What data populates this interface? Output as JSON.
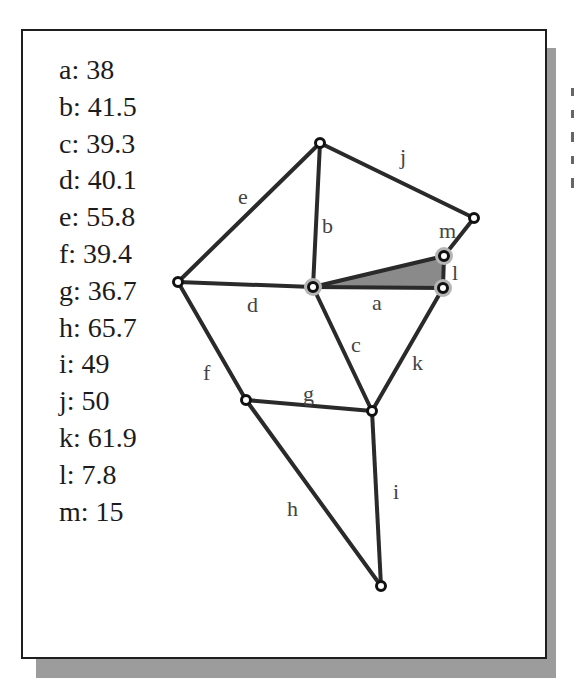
{
  "legend": {
    "items": [
      {
        "label": "a: 38"
      },
      {
        "label": "b: 41.5"
      },
      {
        "label": "c: 39.3"
      },
      {
        "label": "d: 40.1"
      },
      {
        "label": "e: 55.8"
      },
      {
        "label": "f: 39.4"
      },
      {
        "label": "g: 36.7"
      },
      {
        "label": "h: 65.7"
      },
      {
        "label": "i: 49"
      },
      {
        "label": "j: 50"
      },
      {
        "label": "k: 61.9"
      },
      {
        "label": "l: 7.8"
      },
      {
        "label": "m: 15"
      }
    ]
  },
  "graph": {
    "edges": [
      {
        "name": "a",
        "length": 38
      },
      {
        "name": "b",
        "length": 41.5
      },
      {
        "name": "c",
        "length": 39.3
      },
      {
        "name": "d",
        "length": 40.1
      },
      {
        "name": "e",
        "length": 55.8
      },
      {
        "name": "f",
        "length": 39.4
      },
      {
        "name": "g",
        "length": 36.7
      },
      {
        "name": "h",
        "length": 65.7
      },
      {
        "name": "i",
        "length": 49
      },
      {
        "name": "j",
        "length": 50
      },
      {
        "name": "k",
        "length": 61.9
      },
      {
        "name": "l",
        "length": 7.8
      },
      {
        "name": "m",
        "length": 15
      }
    ],
    "labels": {
      "a": "a",
      "b": "b",
      "c": "c",
      "d": "d",
      "e": "e",
      "f": "f",
      "g": "g",
      "h": "h",
      "i": "i",
      "j": "j",
      "k": "k",
      "l": "l",
      "m": "m"
    },
    "highlight_color": "#b5b5b5",
    "triangle_fill": "#8a8a8a"
  }
}
